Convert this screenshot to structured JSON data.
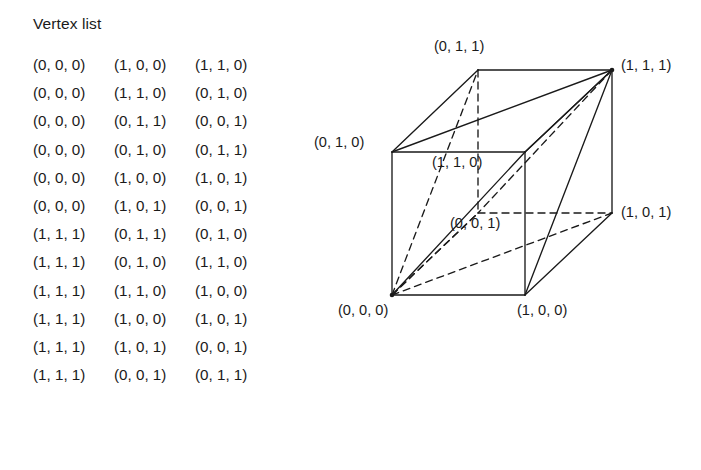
{
  "vertex_list": {
    "title": "Vertex list",
    "columns": [
      "v0",
      "v1",
      "v2"
    ],
    "rows": [
      [
        "(0, 0, 0)",
        "(1, 0, 0)",
        "(1, 1, 0)"
      ],
      [
        "(0, 0, 0)",
        "(1, 1, 0)",
        "(0, 1, 0)"
      ],
      [
        "(0, 0, 0)",
        "(0, 1, 1)",
        "(0, 0, 1)"
      ],
      [
        "(0, 0, 0)",
        "(0, 1, 0)",
        "(0, 1, 1)"
      ],
      [
        "(0, 0, 0)",
        "(1, 0, 0)",
        "(1, 0, 1)"
      ],
      [
        "(0, 0, 0)",
        "(1, 0, 1)",
        "(0, 0, 1)"
      ],
      [
        "(1, 1, 1)",
        "(0, 1, 1)",
        "(0, 1, 0)"
      ],
      [
        "(1, 1, 1)",
        "(0, 1, 0)",
        "(1, 1, 0)"
      ],
      [
        "(1, 1, 1)",
        "(1, 1, 0)",
        "(1, 0, 0)"
      ],
      [
        "(1, 1, 1)",
        "(1, 0, 0)",
        "(1, 0, 1)"
      ],
      [
        "(1, 1, 1)",
        "(1, 0, 1)",
        "(0, 0, 1)"
      ],
      [
        "(1, 1, 1)",
        "(0, 0, 1)",
        "(0, 1, 1)"
      ]
    ]
  },
  "cube": {
    "labels": {
      "front_bottom_left": "(0, 0, 0)",
      "front_bottom_right": "(1, 0, 0)",
      "front_top_left": "(0, 1, 0)",
      "front_top_right": "(1, 1, 0)",
      "back_bottom_left": "(0, 0, 1)",
      "back_bottom_right": "(1, 0, 1)",
      "back_top_left": "(0, 1, 1)",
      "back_top_right": "(1, 1, 1)"
    },
    "stroke_color": "#1a1a1a",
    "background_color": "#ffffff"
  }
}
